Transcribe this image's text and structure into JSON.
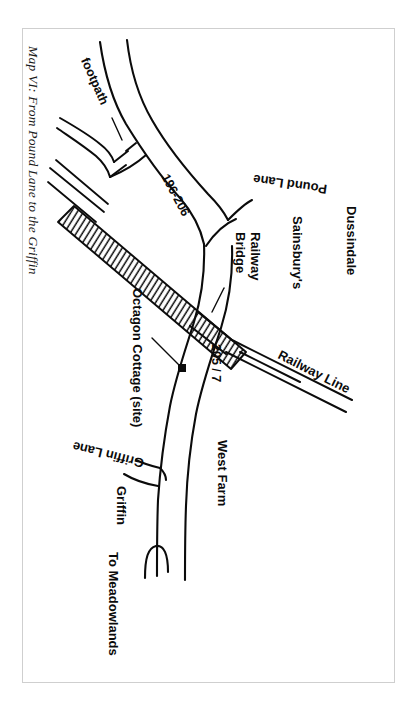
{
  "document": {
    "kind": "sketch-map",
    "title": "Map VI: From Pound Lane to the Griffin",
    "frame_color": "#cfcfcf",
    "ink_color": "#0b0b0b",
    "background_color": "#ffffff",
    "orientation_note": "map drawn rotated; most labels read top-to-bottom"
  },
  "labels": {
    "title": "Map VI: From Pound Lane to the Griffin",
    "footpath": "footpath",
    "house_numbers_north": "196-206",
    "pound_lane": "Pound Lane",
    "dussindale": "Dussindale",
    "sainsburys": "Sainsbury's",
    "railway_bridge_line1": "Railway",
    "railway_bridge_line2": "Bridge",
    "octagon_cottage": "Octagon Cottage (site)",
    "house_numbers_south": "205 / 7",
    "railway_line": "Railway Line",
    "griffin_lane": "Griffin Lane",
    "griffin": "Griffin",
    "west_farm": "West Farm",
    "to_meadowlands": "To Meadowlands"
  },
  "features": {
    "railway_band": "hatched embankment band running diagonally from upper-left to lower-right",
    "site_marker": "filled black square marking Octagon Cottage site",
    "leader_lines": [
      "footpath leader",
      "railway bridge leader",
      "octagon cottage leader"
    ],
    "roads": [
      "Pound Lane",
      "Griffin Lane",
      "main road to Meadowlands",
      "footpath"
    ]
  }
}
